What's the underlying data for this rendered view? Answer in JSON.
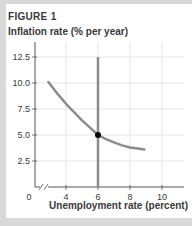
{
  "figure": {
    "title": "FIGURE 1",
    "y_axis_label": "Inflation rate (% per year)",
    "x_axis_label": "Unemployment rate (percent)"
  },
  "colors": {
    "curve": "#8c8c8c",
    "vertical_line": "#8c8c8c",
    "point": "#000000",
    "grid": "#e6e6e6",
    "axis": "#555555",
    "background": "#ffffff",
    "frame": "#d9d9d9"
  },
  "chart_data": {
    "type": "line",
    "title": "FIGURE 1",
    "xlabel": "Unemployment rate (percent)",
    "ylabel": "Inflation rate (% per year)",
    "xlim": [
      0,
      11.5
    ],
    "ylim": [
      0,
      13.5
    ],
    "x_axis_break": true,
    "x_ticks": [
      "0",
      "4",
      "6",
      "8",
      "10"
    ],
    "y_ticks": [
      "2.5",
      "5.0",
      "7.5",
      "10.0",
      "12.5"
    ],
    "grid": true,
    "series": [
      {
        "name": "Short-run Phillips curve",
        "style": "curve",
        "x": [
          2.9,
          3.5,
          4.0,
          4.5,
          5.0,
          5.5,
          6.0,
          6.5,
          7.0,
          7.5,
          8.0,
          8.5,
          8.9
        ],
        "y": [
          10.1,
          8.9,
          8.0,
          7.2,
          6.4,
          5.7,
          5.0,
          4.6,
          4.3,
          4.0,
          3.8,
          3.7,
          3.6
        ]
      },
      {
        "name": "Long-run Phillips curve",
        "style": "vertical-line",
        "x": [
          6,
          6
        ],
        "y": [
          0,
          12.5
        ]
      }
    ],
    "annotations": [
      {
        "type": "point",
        "x": 6,
        "y": 5.0
      }
    ]
  }
}
